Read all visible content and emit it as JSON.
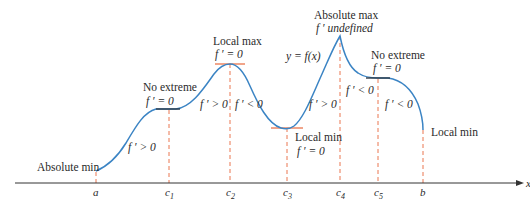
{
  "figure": {
    "function_label": "y = f(x)",
    "axis_label": "x",
    "colors": {
      "curve": "#3b84c4",
      "plateau": "#2f3a46",
      "tangent": "#e8683c",
      "guide": "#e8683c",
      "axis": "#333333",
      "text": "#2a2a2a"
    },
    "x_ticks": [
      {
        "label": "a",
        "sub": "",
        "x": 96
      },
      {
        "label": "c",
        "sub": "1",
        "x": 169
      },
      {
        "label": "c",
        "sub": "2",
        "x": 230
      },
      {
        "label": "c",
        "sub": "3",
        "x": 287
      },
      {
        "label": "c",
        "sub": "4",
        "x": 340
      },
      {
        "label": "c",
        "sub": "5",
        "x": 378
      },
      {
        "label": "b",
        "sub": "",
        "x": 423
      }
    ],
    "annotations": {
      "absolute_min": {
        "title": "Absolute min"
      },
      "no_extreme_1": {
        "title": "No extreme",
        "condition": "f ′ = 0"
      },
      "local_max": {
        "title": "Local max",
        "condition": "f ′ = 0"
      },
      "local_min_c3": {
        "title": "Local min",
        "condition": "f ′ = 0"
      },
      "absolute_max": {
        "title": "Absolute max",
        "condition": "f ′  undefined"
      },
      "no_extreme_2": {
        "title": "No extreme",
        "condition": "f ′ = 0"
      },
      "local_min_b": {
        "title": "Local min"
      }
    },
    "derivative_signs": [
      {
        "id": "a_c1",
        "text": "f ′ > 0"
      },
      {
        "id": "c1_c2",
        "text": "f ′ > 0"
      },
      {
        "id": "c2_c3",
        "text": "f ′ < 0"
      },
      {
        "id": "c3_c4",
        "text": "f ′ > 0"
      },
      {
        "id": "c4_c5",
        "text": "f ′ < 0"
      },
      {
        "id": "c5_b",
        "text": "f ′ < 0"
      }
    ]
  }
}
